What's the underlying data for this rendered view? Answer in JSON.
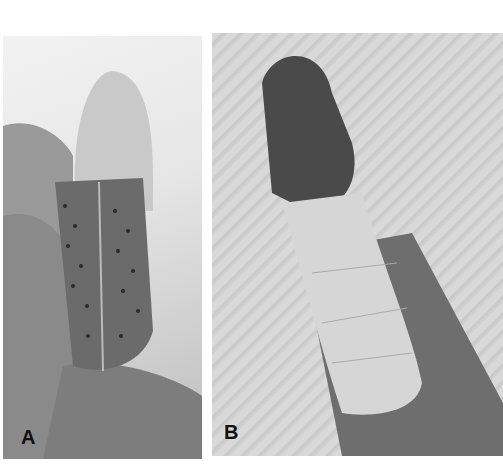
{
  "figure": {
    "panels": [
      {
        "label": "A",
        "description": "Finger inside perforated metal/thermoplastic splint held by hand"
      },
      {
        "label": "B",
        "description": "Finger tip wrapped with bandage tape, thumb up"
      }
    ]
  }
}
